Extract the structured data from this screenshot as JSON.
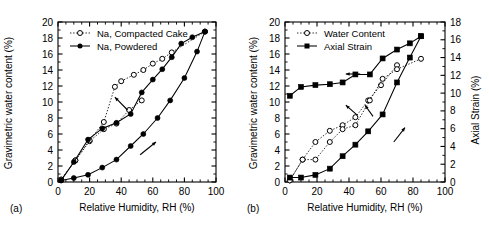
{
  "figure": {
    "panel_a_tag": "(a)",
    "panel_b_tag": "(b)"
  },
  "chart_data": [
    {
      "type": "line",
      "panel": "(a)",
      "title": "",
      "xlabel": "Relative Humidity, RH (%)",
      "ylabel": "Gravimetric water content (%)",
      "xlim": [
        0,
        100
      ],
      "ylim": [
        0,
        20
      ],
      "xticks": [
        0,
        20,
        40,
        60,
        80,
        100
      ],
      "yticks": [
        0,
        2,
        4,
        6,
        8,
        10,
        12,
        14,
        16,
        18,
        20
      ],
      "grid": false,
      "legend_position": "top-left",
      "annotations": [
        "wetting arrow (lower right, pointing up-right)",
        "drying arrow (upper left, pointing up-left)"
      ],
      "series": [
        {
          "name": "Na, Compacted Cake",
          "marker": "open-circle",
          "linestyle": "dotted",
          "branch": "adsorption",
          "x": [
            2,
            11,
            20,
            29,
            37,
            45,
            53
          ],
          "y": [
            0.3,
            2.7,
            5.1,
            6.6,
            7.3,
            9.0,
            10.2
          ]
        },
        {
          "name": "Na, Compacted Cake",
          "marker": "open-circle",
          "linestyle": "dotted",
          "branch": "desorption",
          "x": [
            93,
            72,
            66,
            60,
            54,
            48,
            40,
            36,
            29,
            20,
            11,
            2
          ],
          "y": [
            18.8,
            16.2,
            15.4,
            14.8,
            14.0,
            13.4,
            12.6,
            11.9,
            7.5,
            5.2,
            2.7,
            0.3
          ]
        },
        {
          "name": "Na, Powdered",
          "marker": "filled-circle",
          "linestyle": "solid",
          "branch": "adsorption",
          "x": [
            2,
            10,
            19,
            28,
            37,
            46,
            54,
            63,
            71,
            80,
            88,
            93
          ],
          "y": [
            0.2,
            0.5,
            0.9,
            1.8,
            2.8,
            4.5,
            6.0,
            8.0,
            10.2,
            13.0,
            16.3,
            18.8
          ]
        },
        {
          "name": "Na, Powdered",
          "marker": "filled-circle",
          "linestyle": "solid",
          "branch": "desorption",
          "x": [
            93,
            85,
            78,
            72,
            66,
            60,
            53,
            46,
            37,
            28,
            19,
            10,
            2
          ],
          "y": [
            18.8,
            18.1,
            17.3,
            15.6,
            14.1,
            12.8,
            11.2,
            8.5,
            7.4,
            6.7,
            5.3,
            2.5,
            0.2
          ]
        }
      ],
      "legend": [
        {
          "label": "Na, Compacted Cake",
          "marker": "open-circle",
          "linestyle": "dotted"
        },
        {
          "label": "Na, Powdered",
          "marker": "filled-circle",
          "linestyle": "solid"
        }
      ]
    },
    {
      "type": "line",
      "panel": "(b)",
      "title": "",
      "xlabel": "Relative Humidity, RH (%)",
      "ylabel": "Gravimetric water content (%)",
      "ylabel_right": "Axial Strain (%)",
      "xlim": [
        0,
        100
      ],
      "ylim": [
        0,
        20
      ],
      "ylim_right": [
        0,
        18
      ],
      "xticks": [
        0,
        20,
        40,
        60,
        80,
        100
      ],
      "yticks": [
        0,
        2,
        4,
        6,
        8,
        10,
        12,
        14,
        16,
        18,
        20
      ],
      "yticks_right": [
        0,
        2,
        4,
        6,
        8,
        10,
        12,
        14,
        16,
        18
      ],
      "grid": false,
      "legend_position": "top-left",
      "annotations": [
        "wetting arrow lower-right",
        "drying arrows pointing up-left"
      ],
      "series": [
        {
          "name": "Water Content",
          "axis": "left",
          "marker": "open-circle",
          "linestyle": "dotted",
          "branch": "adsorption",
          "x": [
            3,
            11,
            19,
            28,
            36,
            44,
            52,
            60,
            70
          ],
          "y": [
            0.2,
            2.8,
            5.0,
            6.4,
            7.1,
            8.1,
            10.2,
            12.1,
            14.6
          ]
        },
        {
          "name": "Water Content",
          "axis": "left",
          "marker": "open-circle",
          "linestyle": "dotted",
          "branch": "desorption",
          "x": [
            85,
            70,
            61,
            53,
            44,
            36,
            28,
            19,
            11,
            3
          ],
          "y": [
            15.4,
            14.1,
            12.9,
            10.2,
            7.1,
            6.6,
            5.0,
            2.8,
            2.8,
            0.2
          ]
        },
        {
          "name": "Axial Strain",
          "axis": "right",
          "marker": "filled-square",
          "linestyle": "solid",
          "branch": "adsorption",
          "x": [
            3,
            10,
            19,
            28,
            36,
            44,
            52,
            61,
            70,
            78,
            85
          ],
          "y": [
            0.5,
            0.5,
            0.8,
            1.5,
            2.9,
            4.2,
            5.7,
            7.6,
            11.2,
            14.0,
            16.4
          ]
        },
        {
          "name": "Axial Strain",
          "axis": "right",
          "marker": "filled-square",
          "linestyle": "solid",
          "branch": "desorption",
          "x": [
            85,
            78,
            70,
            61,
            53,
            44,
            36,
            28,
            19,
            10,
            3
          ],
          "y": [
            16.4,
            15.6,
            14.9,
            13.9,
            12.1,
            12.1,
            11.2,
            11.0,
            10.9,
            10.7,
            9.7
          ]
        }
      ],
      "legend": [
        {
          "label": "Water Content",
          "marker": "open-circle",
          "linestyle": "dotted"
        },
        {
          "label": "Axial Strain",
          "marker": "filled-square",
          "linestyle": "solid"
        }
      ]
    }
  ]
}
